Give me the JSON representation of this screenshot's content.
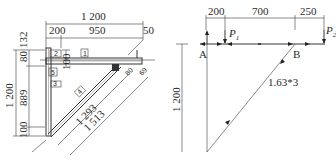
{
  "left_drawing": {
    "title": "Triangular bracket detail",
    "top_dims": {
      "overall": "1 200",
      "left": "200",
      "middle": "950",
      "right": "50"
    },
    "left_dims": {
      "overall": "1 200",
      "top_a": "80",
      "top_b": "132",
      "middle": "889",
      "bottom": "100"
    },
    "inner_dims": {
      "flange": "100",
      "brace_offset": "80",
      "end": "69"
    },
    "diagonal_dims": {
      "inner": "1 293",
      "outer": "1 513"
    },
    "part_tags": [
      "1",
      "2",
      "5",
      "3",
      "4"
    ]
  },
  "right_drawing": {
    "title": "Structural calculation diagram",
    "top_dims": {
      "a": "200",
      "b": "700",
      "c": "250"
    },
    "loads": {
      "p1": "P",
      "p1_sub": "1",
      "p2": "P",
      "p2_sub": "2"
    },
    "nodes": {
      "a": "A",
      "b": "B"
    },
    "height_dim": "1 200",
    "member_label": "1.63*3"
  }
}
